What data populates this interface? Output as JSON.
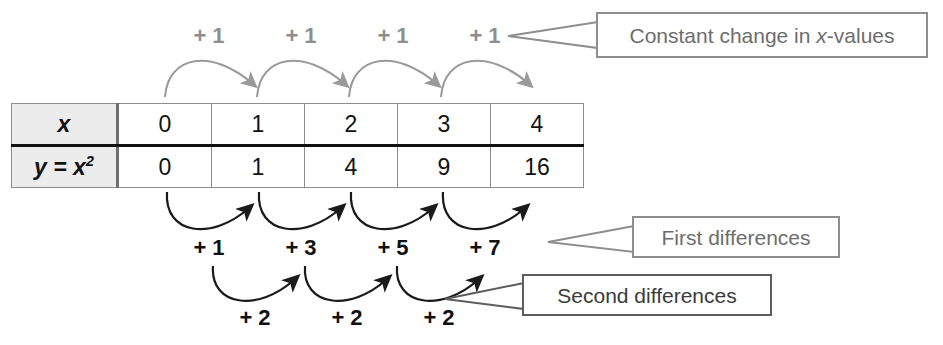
{
  "diagram": {
    "table": {
      "row_labels": [
        "x",
        "y = x²"
      ],
      "x_label_plain": "x",
      "y_label_base": "y = x",
      "y_label_exponent": "2",
      "x_values": [
        "0",
        "1",
        "2",
        "3",
        "4"
      ],
      "y_values": [
        "0",
        "1",
        "4",
        "9",
        "16"
      ],
      "header_bg": "#ececec",
      "border_color": "#8d8d8d",
      "divider_color": "#111111"
    },
    "top_differences": {
      "labels": [
        "+ 1",
        "+ 1",
        "+ 1",
        "+ 1"
      ],
      "color": "#8e8e8e",
      "arrow_color": "#9a9a9a"
    },
    "first_differences": {
      "labels": [
        "+ 1",
        "+ 3",
        "+ 5",
        "+ 7"
      ],
      "color": "#111111",
      "arrow_color": "#1a1a1a"
    },
    "second_differences": {
      "labels": [
        "+ 2",
        "+ 2",
        "+ 2"
      ],
      "color": "#111111",
      "arrow_color": "#1a1a1a"
    },
    "callouts": {
      "constant_change": {
        "text_before": "Constant change in ",
        "text_italic": "x",
        "text_after": "-values",
        "full_text": "Constant change in x-values"
      },
      "first_differences_label": "First differences",
      "second_differences_label": "Second differences"
    }
  }
}
